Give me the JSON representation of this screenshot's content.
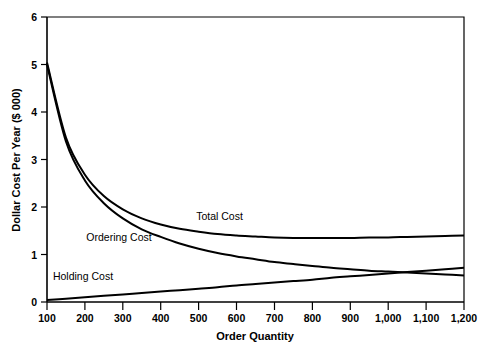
{
  "chart_data": {
    "type": "line",
    "title": "",
    "xlabel": "Order Quantity",
    "ylabel": "Dollar Cost Per Year ($ 000)",
    "xlim": [
      100,
      1200
    ],
    "ylim": [
      0,
      6
    ],
    "xticks": [
      100,
      200,
      300,
      400,
      500,
      600,
      700,
      800,
      900,
      1000,
      1100,
      1200
    ],
    "xticklabels": [
      "100",
      "200",
      "300",
      "400",
      "500",
      "600",
      "700",
      "800",
      "900",
      "1,000",
      "1,100",
      "1,200"
    ],
    "yticks": [
      0,
      1,
      2,
      3,
      4,
      5,
      6
    ],
    "yticklabels": [
      "0",
      "1",
      "2",
      "3",
      "4",
      "5",
      "6"
    ],
    "grid": false,
    "legend_position": "inline-annotations",
    "x": [
      100,
      150,
      200,
      250,
      300,
      350,
      400,
      450,
      500,
      550,
      600,
      650,
      700,
      750,
      800,
      850,
      900,
      950,
      1000,
      1050,
      1100,
      1150,
      1200
    ],
    "series": [
      {
        "name": "Total Cost",
        "color": "#000000",
        "values": [
          5.04,
          3.46,
          2.68,
          2.23,
          1.95,
          1.76,
          1.63,
          1.54,
          1.48,
          1.43,
          1.4,
          1.38,
          1.36,
          1.35,
          1.35,
          1.35,
          1.35,
          1.36,
          1.36,
          1.37,
          1.38,
          1.39,
          1.4
        ]
      },
      {
        "name": "Ordering Cost",
        "color": "#000000",
        "values": [
          5.0,
          3.38,
          2.56,
          2.08,
          1.76,
          1.53,
          1.37,
          1.23,
          1.12,
          1.03,
          0.96,
          0.9,
          0.84,
          0.8,
          0.76,
          0.72,
          0.69,
          0.66,
          0.64,
          0.62,
          0.6,
          0.58,
          0.56
        ]
      },
      {
        "name": "Holding Cost",
        "color": "#000000",
        "values": [
          0.04,
          0.07,
          0.1,
          0.13,
          0.16,
          0.19,
          0.22,
          0.25,
          0.28,
          0.31,
          0.35,
          0.38,
          0.41,
          0.44,
          0.47,
          0.51,
          0.54,
          0.57,
          0.6,
          0.63,
          0.66,
          0.69,
          0.72
        ]
      }
    ],
    "annotations": [
      {
        "text": "Total Cost",
        "x": 555,
        "y": 1.72
      },
      {
        "text": "Ordering Cost",
        "x": 290,
        "y": 1.28
      },
      {
        "text": "Holding Cost",
        "x": 195,
        "y": 0.46
      }
    ]
  }
}
